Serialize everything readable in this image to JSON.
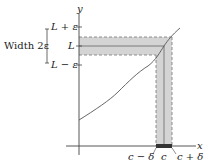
{
  "diagram": {
    "axis_x_label": "x",
    "axis_y_label": "y",
    "y_labels": {
      "top": "L + ε",
      "mid": "L",
      "bottom": "L − ε"
    },
    "width_label": "Width 2ε",
    "x_labels": {
      "left": "c − δ",
      "mid": "c",
      "right": "c + δ"
    },
    "colors": {
      "band": "#cfcfcf",
      "line": "#444444",
      "bar": "#333333"
    }
  }
}
